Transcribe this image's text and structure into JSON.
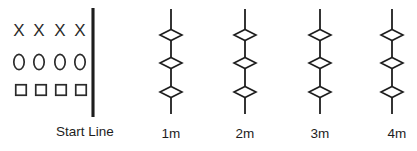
{
  "diagram": {
    "background_color": "#ffffff",
    "ink_color": "#1d1d1d",
    "start_line": {
      "label": "Start Line",
      "label_x": 85,
      "label_y": 136,
      "x": 93,
      "y_top": 8,
      "y_bottom": 117
    },
    "player_rows": [
      {
        "row_name": "x-row",
        "glyph": "X",
        "glyph_type": "letter-x",
        "count": 4,
        "y": 32,
        "x_positions": [
          19,
          39,
          60,
          80
        ]
      },
      {
        "row_name": "o-row",
        "glyph": "0",
        "glyph_type": "oval",
        "count": 4,
        "y": 62,
        "x_positions": [
          19,
          39,
          60,
          80
        ]
      },
      {
        "row_name": "square-row",
        "glyph": "□",
        "glyph_type": "square",
        "count": 4,
        "y": 90,
        "x_positions": [
          21,
          41,
          61,
          81
        ]
      }
    ],
    "markers": [
      {
        "label": "1m",
        "x": 171,
        "label_x": 171,
        "y_top": 9,
        "y_bottom": 114,
        "diamond_y": [
          35,
          63,
          92
        ]
      },
      {
        "label": "2m",
        "x": 245,
        "label_x": 245,
        "y_top": 9,
        "y_bottom": 114,
        "diamond_y": [
          35,
          63,
          92
        ]
      },
      {
        "label": "3m",
        "x": 320,
        "label_x": 320,
        "y_top": 9,
        "y_bottom": 114,
        "diamond_y": [
          35,
          63,
          92
        ]
      },
      {
        "label": "4m",
        "x": 392,
        "label_x": 397,
        "y_top": 9,
        "y_bottom": 114,
        "diamond_y": [
          35,
          63,
          92
        ]
      }
    ],
    "diamond_geometry": {
      "half_width": 11,
      "half_height": 5.5
    },
    "labels_baseline_y": 138
  }
}
